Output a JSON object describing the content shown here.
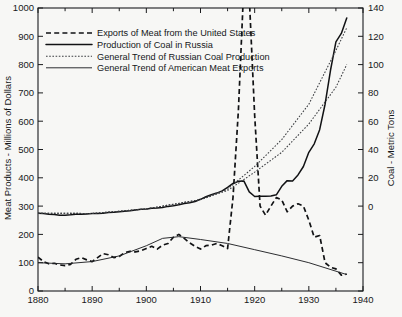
{
  "chart_data": {
    "type": "line",
    "title": "",
    "subtitle": "",
    "xlabel": "",
    "ylabel": "Meat Products - Millions of Dollars",
    "y2label": "Coal - Metric Tons",
    "xlim": [
      1880,
      1940
    ],
    "ylim": [
      0,
      1000
    ],
    "y2lim": [
      -60,
      140
    ],
    "grid": false,
    "legend_position": "top-left",
    "x_ticks": [
      1880,
      1890,
      1900,
      1910,
      1920,
      1930,
      1940
    ],
    "x_tick_labels": [
      "1880",
      "1890",
      "1900",
      "1910",
      "1920",
      "1930",
      "1940"
    ],
    "x_minor_ticks": [
      1885,
      1895,
      1905,
      1915,
      1925,
      1935
    ],
    "y_ticks": [
      0,
      100,
      200,
      300,
      400,
      500,
      600,
      700,
      800,
      900,
      1000
    ],
    "y_tick_labels": [
      "0",
      "100",
      "200",
      "300",
      "400",
      "500",
      "600",
      "700",
      "800",
      "900",
      "1000"
    ],
    "y2_ticks": [
      -60,
      -40,
      -20,
      0,
      20,
      40,
      60,
      80,
      100,
      120,
      140
    ],
    "y2_tick_labels": [
      "",
      "",
      "",
      "0",
      "20",
      "40",
      "60",
      "80",
      "100",
      "120",
      "140"
    ],
    "series": [
      {
        "name": "Exports of Meat from the United States",
        "style": "dashed",
        "axis": "left",
        "unit": "Millions of Dollars",
        "x": [
          1880,
          1881,
          1882,
          1883,
          1884,
          1885,
          1886,
          1887,
          1888,
          1889,
          1890,
          1891,
          1892,
          1893,
          1894,
          1895,
          1896,
          1897,
          1898,
          1899,
          1900,
          1901,
          1902,
          1903,
          1904,
          1905,
          1906,
          1907,
          1908,
          1909,
          1910,
          1911,
          1912,
          1913,
          1914,
          1915,
          1916,
          1917,
          1918,
          1919,
          1920,
          1921,
          1922,
          1923,
          1924,
          1925,
          1926,
          1927,
          1928,
          1929,
          1930,
          1931,
          1932,
          1933,
          1934,
          1935,
          1936,
          1937
        ],
        "y": [
          120,
          104,
          96,
          98,
          92,
          90,
          94,
          112,
          118,
          110,
          104,
          118,
          132,
          128,
          118,
          122,
          136,
          140,
          138,
          142,
          150,
          158,
          148,
          162,
          168,
          190,
          200,
          186,
          170,
          158,
          148,
          160,
          162,
          168,
          160,
          150,
          330,
          640,
          1080,
          1040,
          620,
          300,
          268,
          300,
          330,
          322,
          280,
          300,
          308,
          300,
          250,
          190,
          196,
          100,
          84,
          78,
          56,
          60
        ]
      },
      {
        "name": "Production of Coal in Russia",
        "style": "solid",
        "axis": "right",
        "unit": "Metric Tons",
        "x": [
          1880,
          1881,
          1882,
          1883,
          1884,
          1885,
          1886,
          1887,
          1888,
          1889,
          1890,
          1891,
          1892,
          1893,
          1894,
          1895,
          1896,
          1897,
          1898,
          1899,
          1900,
          1901,
          1902,
          1903,
          1904,
          1905,
          1906,
          1907,
          1908,
          1909,
          1910,
          1911,
          1912,
          1913,
          1914,
          1915,
          1916,
          1917,
          1918,
          1919,
          1920,
          1921,
          1922,
          1923,
          1924,
          1925,
          1926,
          1927,
          1928,
          1929,
          1930,
          1931,
          1932,
          1933,
          1934,
          1935,
          1936,
          1937
        ],
        "y": [
          -5.0,
          -5.3,
          -5.7,
          -6.0,
          -6.4,
          -6.4,
          -6.2,
          -5.8,
          -5.8,
          -5.5,
          -5.3,
          -5.2,
          -5.0,
          -4.6,
          -4.4,
          -4.0,
          -3.6,
          -3.3,
          -2.8,
          -2.3,
          -2.0,
          -1.6,
          -1.4,
          -1.0,
          -0.2,
          0.2,
          1.0,
          1.9,
          2.4,
          3.3,
          4.8,
          6.6,
          8.0,
          9.2,
          10.8,
          13.2,
          16.0,
          17.5,
          17.8,
          10.0,
          6.8,
          7.0,
          7.0,
          7.2,
          8.0,
          14.0,
          18.0,
          17.8,
          22.0,
          28.0,
          38.0,
          44.0,
          54.0,
          72.0,
          96.0,
          116.0,
          122.0,
          133.0
        ]
      },
      {
        "name": "General Trend of Russian Coal Production",
        "style": "dotted",
        "axis": "right",
        "unit": "Metric Tons",
        "x": [
          1880,
          1890,
          1900,
          1910,
          1915,
          1920,
          1925,
          1930,
          1935,
          1937
        ],
        "y": [
          -5.0,
          -5.2,
          -2.0,
          4.6,
          12.0,
          28.0,
          47.0,
          72.0,
          110.0,
          126.0
        ]
      },
      {
        "name": "General Trend of American Meat Exports",
        "style": "thin",
        "axis": "left",
        "unit": "Millions of Dollars",
        "x": [
          1880,
          1885,
          1890,
          1895,
          1900,
          1903,
          1906,
          1910,
          1915,
          1920,
          1925,
          1930,
          1935,
          1937
        ],
        "y": [
          100,
          96,
          104,
          124,
          160,
          186,
          192,
          182,
          168,
          146,
          124,
          100,
          70,
          58
        ]
      },
      {
        "name": "General Trend of Russian Coal Production (secondary)",
        "style": "dotted",
        "axis": "right",
        "unit": "Metric Tons",
        "x": [
          1880,
          1890,
          1900,
          1910,
          1915,
          1920,
          1925,
          1930,
          1935,
          1937
        ],
        "y": [
          -5.0,
          -5.2,
          -2.0,
          4.6,
          11.0,
          24.0,
          38.0,
          58.0,
          84.0,
          100.0
        ]
      }
    ],
    "legend_entries": [
      {
        "label": "Exports of Meat from the United States",
        "style": "dashed"
      },
      {
        "label": "Production of Coal in Russia",
        "style": "solid"
      },
      {
        "label": "General Trend of Russian Coal Production",
        "style": "dotted"
      },
      {
        "label": "General Trend of American Meat Exports",
        "style": "thin"
      }
    ],
    "annotations": []
  },
  "colors": {
    "background": "#f7f7f5",
    "ink": "#111214",
    "frame": "#1b1c1e",
    "faint_ink": "#3a3c40"
  }
}
